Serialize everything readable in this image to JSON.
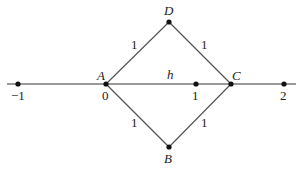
{
  "diagram": {
    "type": "rhombus-on-number-line",
    "vertices": {
      "A": {
        "label": "A",
        "x": 106,
        "y": 84
      },
      "B": {
        "label": "B",
        "x": 169,
        "y": 147
      },
      "C": {
        "label": "C",
        "x": 231,
        "y": 84
      },
      "D": {
        "label": "D",
        "x": 169,
        "y": 22
      }
    },
    "edges": [
      {
        "from": "A",
        "to": "D",
        "label": "1"
      },
      {
        "from": "D",
        "to": "C",
        "label": "1"
      },
      {
        "from": "A",
        "to": "B",
        "label": "1"
      },
      {
        "from": "B",
        "to": "C",
        "label": "1"
      }
    ],
    "segment_label": "h",
    "number_line": {
      "ticks": [
        {
          "label": "−1",
          "x": 18
        },
        {
          "label": "0",
          "x": 106
        },
        {
          "label": "1",
          "x": 196
        },
        {
          "label": "2",
          "x": 284
        }
      ]
    },
    "colors": {
      "line": "#555555",
      "axis": "#777777",
      "point": "#111111",
      "text": "#222222"
    }
  }
}
